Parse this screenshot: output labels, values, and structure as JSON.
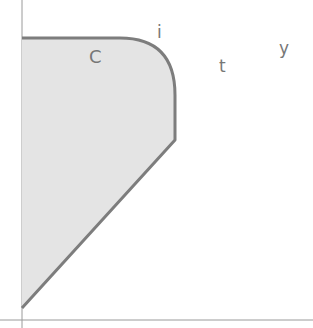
{
  "diagram": {
    "labels": {
      "c": "C",
      "i": "i",
      "t": "t",
      "y": "y"
    },
    "colors": {
      "fill": "#e4e4e4",
      "outline": "#7d7d7d",
      "axis": "#9a9a9a",
      "text": "#777777"
    }
  }
}
